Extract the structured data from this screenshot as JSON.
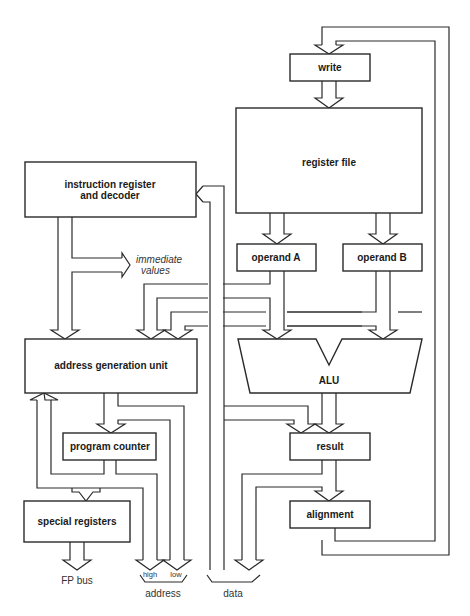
{
  "diagram": {
    "blocks": {
      "write": "write",
      "register_file": "register file",
      "instruction_register_line1": "instruction register",
      "instruction_register_line2": "and decoder",
      "operand_a": "operand A",
      "operand_b": "operand B",
      "alu": "ALU",
      "address_generation_unit": "address generation unit",
      "program_counter": "program counter",
      "result": "result",
      "special_registers": "special registers",
      "alignment": "alignment"
    },
    "labels": {
      "immediate_line1": "immediate",
      "immediate_line2": "values",
      "fp_bus": "FP bus",
      "high": "high",
      "low": "low",
      "address": "address",
      "data": "data"
    }
  }
}
